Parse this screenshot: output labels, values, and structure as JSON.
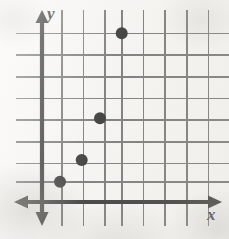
{
  "figure": {
    "kind": "coordinate-plane-scatter-plot",
    "title": "",
    "background_color": "#f6f5f3",
    "ink_color": "#111111",
    "grid_color": "#5d5d5d"
  },
  "axes": {
    "x_label": "x",
    "y_label": "y",
    "x_axis_pixel_y": 202,
    "y_axis_pixel_x": 42,
    "x_arrow_left_tip": 14,
    "x_arrow_right_tip": 222,
    "y_arrow_top_tip": 10,
    "y_arrow_bottom_tip": 226,
    "tick_labels_shown": false
  },
  "grid": {
    "visible": true,
    "cell_size_px": 21.7,
    "vertical_lines_px": [
      61.7,
      83.3,
      105,
      121.7,
      143.3,
      165,
      186.7,
      208.3
    ],
    "horizontal_lines_px": [
      33.3,
      55,
      76.7,
      98.3,
      120,
      141.7,
      163.3,
      181.7
    ],
    "vertical_span_px": [
      10,
      226
    ],
    "horizontal_span_px": [
      16,
      229
    ]
  },
  "chart_data": {
    "type": "scatter",
    "title": "",
    "xlabel": "x",
    "ylabel": "y",
    "grid": true,
    "legend": null,
    "xlim": [
      0,
      8.5
    ],
    "ylim": [
      0,
      8.5
    ],
    "xticks": [
      1,
      2,
      3,
      4,
      5,
      6,
      7,
      8
    ],
    "yticks": [
      1,
      2,
      3,
      4,
      5,
      6,
      7,
      8
    ],
    "xtick_labels": [],
    "ytick_labels": [],
    "marker": "filled-circle",
    "marker_color": "#0d0d0d",
    "marker_radius_px": 6,
    "points": [
      {
        "x": 1,
        "y": 1,
        "px": 60.0,
        "py": 181.7
      },
      {
        "x": 2,
        "y": 2,
        "px": 81.7,
        "py": 160.0
      },
      {
        "x": 3,
        "y": 4,
        "px": 100.0,
        "py": 118.3
      },
      {
        "x": 4,
        "y": 8,
        "px": 121.7,
        "py": 33.3
      }
    ],
    "values": [
      [
        1,
        1
      ],
      [
        2,
        2
      ],
      [
        3,
        4
      ],
      [
        4,
        8
      ]
    ],
    "annotations": []
  }
}
